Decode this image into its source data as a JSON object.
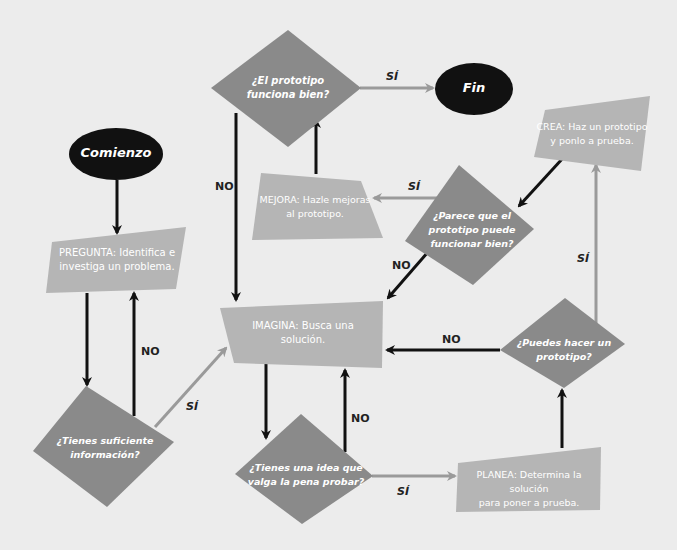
{
  "colors": {
    "background": "#ececec",
    "terminal_fill": "#111111",
    "process_fill": "#b5b5b5",
    "decision_fill": "#8a8a8a",
    "arrow_dark": "#111111",
    "arrow_light": "#9a9a9a",
    "node_text": "#ffffff",
    "edge_label": "#222222"
  },
  "nodes": {
    "start": {
      "label": "Comienzo",
      "shape": "ellipse"
    },
    "end": {
      "label": "Fin",
      "shape": "ellipse"
    },
    "ask": {
      "label_line1": "PREGUNTA: Identifica e",
      "label_line2": "investiga un problema.",
      "shape": "process"
    },
    "enough_info": {
      "label_line1": "¿Tienes suficiente",
      "label_line2": "información?",
      "shape": "decision"
    },
    "imagine": {
      "label_line1": "IMAGINA: Busca una",
      "label_line2": "solución.",
      "shape": "process"
    },
    "idea_worth": {
      "label_line1": "¿Tienes una idea que",
      "label_line2": "valga la pena probar?",
      "shape": "decision"
    },
    "plan": {
      "label_line1": "PLANEA: Determina la solución",
      "label_line2": "para poner a prueba.",
      "shape": "process"
    },
    "can_prototype": {
      "label_line1": "¿Puedes hacer un",
      "label_line2": "prototipo?",
      "shape": "decision"
    },
    "create": {
      "label_line1": "CREA: Haz un prototipo",
      "label_line2": "y ponlo a prueba.",
      "shape": "process"
    },
    "seems_work": {
      "label_line1": "¿Parece que el",
      "label_line2": "prototipo puede",
      "label_line3": "funcionar bien?",
      "shape": "decision"
    },
    "improve": {
      "label_line1": "MEJORA: Hazle mejoras",
      "label_line2": "al prototipo.",
      "shape": "process"
    },
    "works_well": {
      "label_line1": "¿El prototipo",
      "label_line2": "funciona bien?",
      "shape": "decision"
    }
  },
  "edge_labels": {
    "works_yes": "SÍ",
    "works_no": "NO",
    "seems_yes": "SÍ",
    "seems_no": "NO",
    "info_no": "NO",
    "info_yes": "SÍ",
    "idea_no": "NO",
    "idea_yes": "SÍ",
    "proto_no": "NO",
    "proto_yes": "SÍ"
  },
  "edges": [
    {
      "from": "start",
      "to": "ask"
    },
    {
      "from": "ask",
      "to": "enough_info"
    },
    {
      "from": "enough_info",
      "to": "ask",
      "label": "NO"
    },
    {
      "from": "enough_info",
      "to": "imagine",
      "label": "SÍ"
    },
    {
      "from": "imagine",
      "to": "idea_worth"
    },
    {
      "from": "idea_worth",
      "to": "imagine",
      "label": "NO"
    },
    {
      "from": "idea_worth",
      "to": "plan",
      "label": "SÍ"
    },
    {
      "from": "plan",
      "to": "can_prototype"
    },
    {
      "from": "can_prototype",
      "to": "imagine",
      "label": "NO"
    },
    {
      "from": "can_prototype",
      "to": "create",
      "label": "SÍ"
    },
    {
      "from": "create",
      "to": "seems_work"
    },
    {
      "from": "seems_work",
      "to": "improve",
      "label": "SÍ"
    },
    {
      "from": "seems_work",
      "to": "imagine",
      "label": "NO"
    },
    {
      "from": "improve",
      "to": "works_well"
    },
    {
      "from": "works_well",
      "to": "end",
      "label": "SÍ"
    },
    {
      "from": "works_well",
      "to": "imagine",
      "label": "NO"
    }
  ]
}
